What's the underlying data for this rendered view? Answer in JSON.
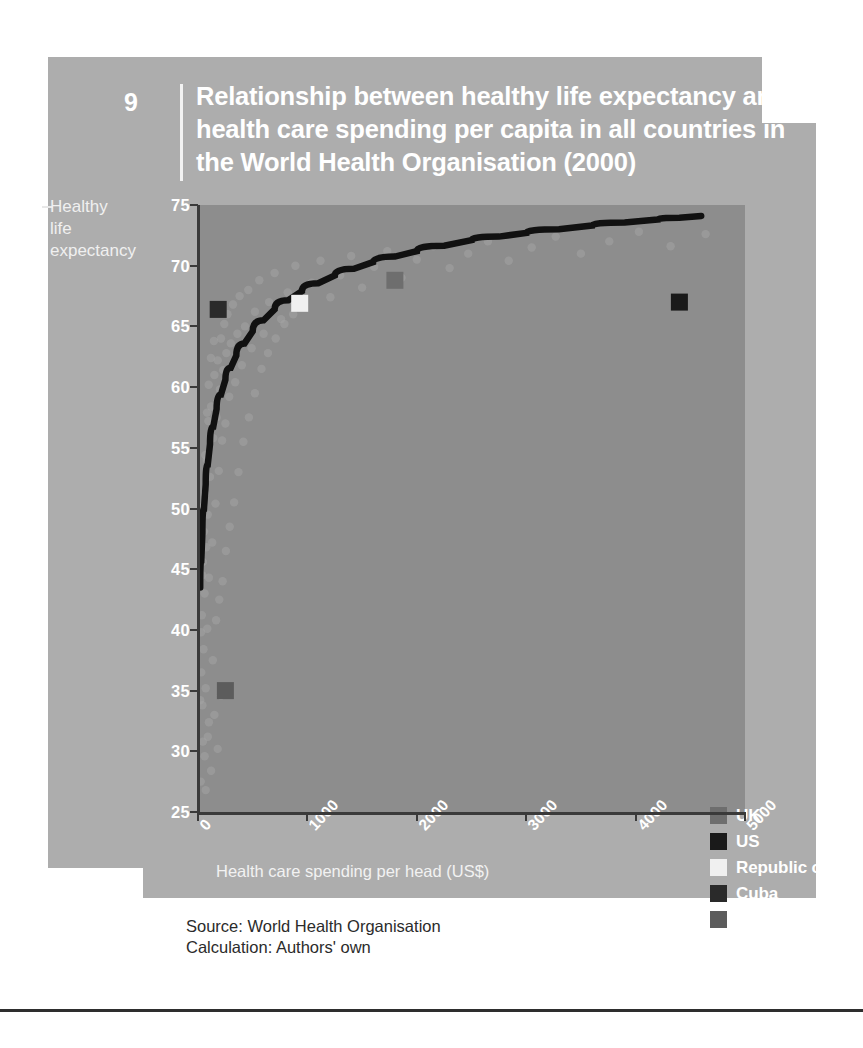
{
  "figure": {
    "number": "9",
    "title": "Relationship between healthy life expectancy and health care spending per capita in all countries in the World Health Organisation (2000)",
    "source_line": "Source:  World Health Organisation",
    "calculation_line": "Calculation: Authors' own"
  },
  "colors": {
    "card": "#adadad",
    "plot_background": "#8d8d8d",
    "axis": "#3a3a3a",
    "trendline": "#111111",
    "scatter": "#a4a4a4",
    "text_light": "#ffffff",
    "text_dark": "#2b2b2b",
    "uk": "#6e6e6e",
    "us": "#1a1a1a",
    "korea": "#f0f0f0",
    "cuba": "#2a2a2a",
    "swaziland": "#5c5c5c"
  },
  "annotation": {
    "r2_prefix": "R",
    "r2_sup": "2",
    "r2_value": "= 0.7"
  },
  "axis_titles": {
    "y": "Healthy life expectancy",
    "y_line1": "Healthy",
    "y_line2": "life",
    "y_line3": "expectancy",
    "x": "Health care spending per head (US$)"
  },
  "chart_data": {
    "type": "scatter",
    "title": "Relationship between healthy life expectancy and health care spending per capita in all countries in the World Health Organisation (2000)",
    "xlabel": "Health care spending per head (US$)",
    "ylabel": "Healthy life expectancy",
    "xlim": [
      0,
      5000
    ],
    "ylim": [
      25,
      75
    ],
    "xticks": [
      "0",
      "1000",
      "2000",
      "3000",
      "4000",
      "5000"
    ],
    "yticks": [
      "75",
      "70",
      "65",
      "60",
      "55",
      "50",
      "45",
      "40",
      "35",
      "30",
      "25"
    ],
    "grid": false,
    "legend_position": "inside-lower-right",
    "trendline": {
      "kind": "logarithmic",
      "r_squared": 0.7,
      "label": "R2 = 0.7",
      "points": [
        [
          20,
          43.5
        ],
        [
          40,
          48.0
        ],
        [
          70,
          52.0
        ],
        [
          110,
          55.3
        ],
        [
          170,
          58.2
        ],
        [
          250,
          60.6
        ],
        [
          350,
          62.6
        ],
        [
          500,
          64.6
        ],
        [
          700,
          66.4
        ],
        [
          950,
          67.9
        ],
        [
          1250,
          69.2
        ],
        [
          1600,
          70.3
        ],
        [
          2000,
          71.2
        ],
        [
          2500,
          72.1
        ],
        [
          3000,
          72.7
        ],
        [
          3600,
          73.3
        ],
        [
          4200,
          73.8
        ],
        [
          4600,
          74.1
        ]
      ]
    },
    "highlighted_countries": [
      {
        "name": "UK",
        "spending": 1800,
        "life_expectancy": 68.8,
        "color": "#6e6e6e"
      },
      {
        "name": "US",
        "spending": 4400,
        "life_expectancy": 67.0,
        "color": "#1a1a1a"
      },
      {
        "name": "Republic of Korea",
        "spending": 930,
        "life_expectancy": 66.9,
        "color": "#f0f0f0"
      },
      {
        "name": "Cuba",
        "spending": 185,
        "life_expectancy": 66.4,
        "color": "#2a2a2a"
      },
      {
        "name": "Swaziland",
        "spending": 250,
        "life_expectancy": 35.0,
        "color": "#5c5c5c"
      }
    ],
    "legend": [
      {
        "label": "UK",
        "color": "#6e6e6e"
      },
      {
        "label": "US",
        "color": "#1a1a1a"
      },
      {
        "label": "Republic of Korea",
        "color": "#f0f0f0"
      },
      {
        "label": "Cuba",
        "color": "#2a2a2a"
      },
      {
        "label": "Swaziland",
        "color": "#5c5c5c"
      }
    ],
    "scatter_points": [
      [
        30,
        36.5
      ],
      [
        35,
        41.2
      ],
      [
        40,
        33.8
      ],
      [
        45,
        45.6
      ],
      [
        50,
        38.4
      ],
      [
        55,
        48.1
      ],
      [
        60,
        43.0
      ],
      [
        65,
        51.2
      ],
      [
        70,
        35.2
      ],
      [
        75,
        46.8
      ],
      [
        80,
        54.0
      ],
      [
        85,
        40.1
      ],
      [
        90,
        49.5
      ],
      [
        95,
        57.2
      ],
      [
        100,
        44.3
      ],
      [
        110,
        52.6
      ],
      [
        120,
        58.4
      ],
      [
        130,
        47.2
      ],
      [
        140,
        55.8
      ],
      [
        150,
        61.0
      ],
      [
        160,
        50.4
      ],
      [
        170,
        57.5
      ],
      [
        180,
        62.2
      ],
      [
        190,
        53.1
      ],
      [
        200,
        59.8
      ],
      [
        210,
        64.0
      ],
      [
        220,
        55.6
      ],
      [
        230,
        61.4
      ],
      [
        240,
        65.2
      ],
      [
        250,
        57.0
      ],
      [
        260,
        62.8
      ],
      [
        270,
        66.0
      ],
      [
        285,
        59.2
      ],
      [
        300,
        63.6
      ],
      [
        320,
        66.8
      ],
      [
        340,
        60.4
      ],
      [
        360,
        64.4
      ],
      [
        380,
        67.5
      ],
      [
        400,
        61.8
      ],
      [
        430,
        65.0
      ],
      [
        460,
        68.0
      ],
      [
        490,
        63.2
      ],
      [
        520,
        66.2
      ],
      [
        560,
        68.8
      ],
      [
        600,
        64.4
      ],
      [
        650,
        67.0
      ],
      [
        700,
        69.4
      ],
      [
        760,
        65.6
      ],
      [
        820,
        67.8
      ],
      [
        890,
        70.0
      ],
      [
        960,
        66.6
      ],
      [
        1040,
        68.6
      ],
      [
        1120,
        70.4
      ],
      [
        1210,
        67.4
      ],
      [
        1300,
        69.2
      ],
      [
        1400,
        70.8
      ],
      [
        1500,
        68.2
      ],
      [
        1610,
        69.9
      ],
      [
        1730,
        71.2
      ],
      [
        1860,
        69.0
      ],
      [
        2000,
        70.5
      ],
      [
        2150,
        71.6
      ],
      [
        2300,
        69.8
      ],
      [
        2470,
        71.0
      ],
      [
        2650,
        72.0
      ],
      [
        2840,
        70.4
      ],
      [
        3050,
        71.5
      ],
      [
        3270,
        72.4
      ],
      [
        3500,
        71.0
      ],
      [
        3760,
        72.0
      ],
      [
        4030,
        72.8
      ],
      [
        4320,
        71.6
      ],
      [
        4640,
        72.6
      ],
      [
        60,
        29.6
      ],
      [
        90,
        31.2
      ],
      [
        120,
        28.4
      ],
      [
        150,
        33.0
      ],
      [
        180,
        30.2
      ],
      [
        210,
        34.6
      ],
      [
        25,
        27.5
      ],
      [
        45,
        30.8
      ],
      [
        70,
        26.8
      ],
      [
        100,
        32.4
      ],
      [
        135,
        37.5
      ],
      [
        165,
        40.8
      ],
      [
        195,
        42.5
      ],
      [
        225,
        44.0
      ],
      [
        255,
        46.5
      ],
      [
        290,
        48.5
      ],
      [
        330,
        50.5
      ],
      [
        370,
        53.0
      ],
      [
        415,
        55.5
      ],
      [
        465,
        57.5
      ],
      [
        520,
        59.5
      ],
      [
        580,
        61.5
      ],
      [
        640,
        62.8
      ],
      [
        710,
        64.0
      ],
      [
        790,
        65.2
      ],
      [
        870,
        66.0
      ],
      [
        20,
        34.2
      ],
      [
        28,
        39.8
      ],
      [
        38,
        44.5
      ],
      [
        52,
        50.2
      ],
      [
        66,
        54.4
      ],
      [
        82,
        57.9
      ],
      [
        98,
        60.2
      ],
      [
        118,
        62.4
      ],
      [
        145,
        63.8
      ]
    ]
  }
}
